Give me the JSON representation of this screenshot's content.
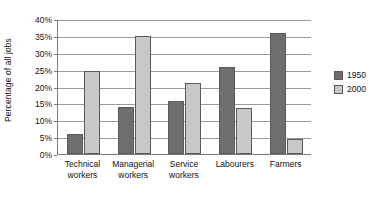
{
  "chart_data": {
    "type": "bar",
    "title": "",
    "xlabel": "",
    "ylabel": "Percentage of all jobs",
    "ylim": [
      0,
      40
    ],
    "ytick_step": 5,
    "ytick_labels": [
      "0%",
      "5%",
      "10%",
      "15%",
      "20%",
      "25%",
      "30%",
      "35%",
      "40%"
    ],
    "grid": true,
    "legend_position": "right",
    "categories": [
      "Technical workers",
      "Managerial workers",
      "Service workers",
      "Labourers",
      "Farmers"
    ],
    "category_lines": [
      [
        "Technical",
        "workers"
      ],
      [
        "Managerial",
        "workers"
      ],
      [
        "Service",
        "workers"
      ],
      [
        "Labourers"
      ],
      [
        "Farmers"
      ]
    ],
    "series": [
      {
        "name": "1950",
        "color": "#6e6e6e",
        "values": [
          6.0,
          13.8,
          15.6,
          25.8,
          35.8
        ]
      },
      {
        "name": "2000",
        "color": "#c8c8c8",
        "values": [
          24.5,
          35.0,
          21.0,
          13.5,
          4.5
        ]
      }
    ]
  },
  "legend": {
    "items": [
      {
        "label": "1950"
      },
      {
        "label": "2000"
      }
    ]
  }
}
